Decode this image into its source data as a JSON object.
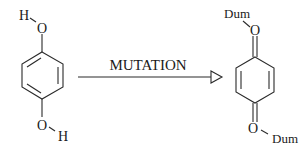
{
  "diagram": {
    "type": "chemical-reaction",
    "reactant": {
      "name": "hydroquinone",
      "atoms": {
        "top_o": "O",
        "top_h": "H",
        "bottom_o": "O",
        "bottom_h": "H"
      }
    },
    "arrow": {
      "label": "MUTATION",
      "head_style": "hollow-triangle"
    },
    "product": {
      "name": "quinone-derivative",
      "atoms": {
        "top_o": "O",
        "top_dum": "Dum",
        "bottom_o": "O",
        "bottom_dum": "Dum"
      }
    },
    "colors": {
      "ink": "#2a2a2a",
      "background": "#ffffff"
    }
  }
}
